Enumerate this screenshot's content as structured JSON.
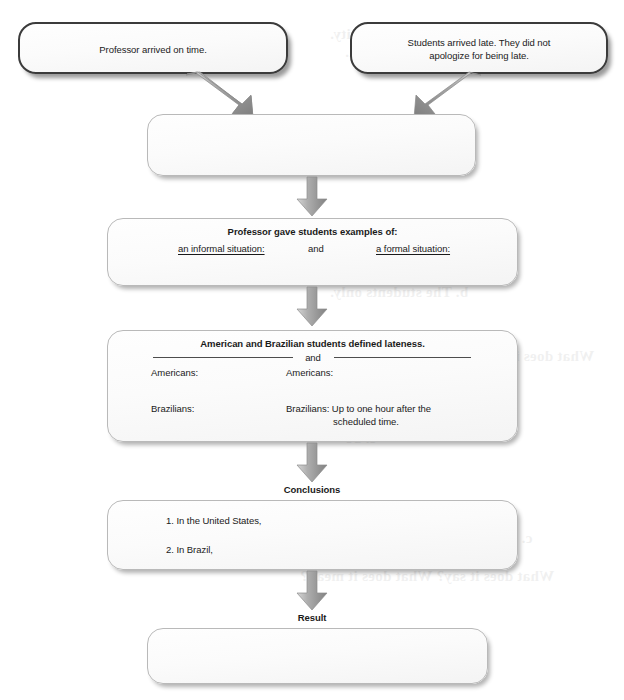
{
  "diagram": {
    "colors": {
      "box_border_top": "#3b3b3b",
      "box_border": "#b9b9b9",
      "box_fill": "#fbfbfb",
      "arrow_fill": "#9a9a9a",
      "text": "#1a1a1a"
    },
    "nodes": {
      "premise_left": {
        "text": "Professor arrived on time."
      },
      "premise_right": {
        "line1": "Students arrived late. They did not",
        "line2": "apologize for being late."
      },
      "merge_box": {
        "text": ""
      },
      "examples_box": {
        "heading": "Professor gave students examples of:",
        "col_left": "an informal situation:",
        "conjunction": "and",
        "col_right": "a formal situation:"
      },
      "lateness_box": {
        "heading": "American and Brazilian students defined lateness.",
        "conjunction": "and",
        "left_americans": "Americans:",
        "left_brazilians": "Brazilians:",
        "right_americans": "Americans:",
        "right_brazilians_line1": "Brazilians: Up to one hour after the",
        "right_brazilians_line2": "scheduled time."
      },
      "conclusions_box": {
        "item1": "1. In the United States,",
        "item2": "2. In Brazil,"
      },
      "result_box": {
        "text": ""
      }
    },
    "captions": {
      "conclusions": "Conclusions",
      "result": "Result"
    },
    "arrows": [
      {
        "name": "arrow-left-diagonal",
        "from": "premise_left",
        "to": "merge_box",
        "direction": "down-right"
      },
      {
        "name": "arrow-right-diagonal",
        "from": "premise_right",
        "to": "merge_box",
        "direction": "down-left"
      },
      {
        "name": "arrow-merge-to-examples",
        "from": "merge_box",
        "to": "examples_box",
        "direction": "down"
      },
      {
        "name": "arrow-examples-to-lateness",
        "from": "examples_box",
        "to": "lateness_box",
        "direction": "down"
      },
      {
        "name": "arrow-lateness-to-conclusions",
        "from": "lateness_box",
        "to": "conclusions_box",
        "direction": "down"
      },
      {
        "name": "arrow-conclusions-to-result",
        "from": "conclusions_box",
        "to": "result_box",
        "direction": "down"
      }
    ],
    "bleed_through": [
      "a. It shows a similarity.",
      "b. It gives more information.",
      "a. No one.",
      "b. The students only.",
      "only...but...also",
      "a. And",
      "b. But",
      "c. So",
      "b. Something that I love",
      "c. Explain to the previous idea",
      "What does it say? What does it mean?"
    ]
  }
}
